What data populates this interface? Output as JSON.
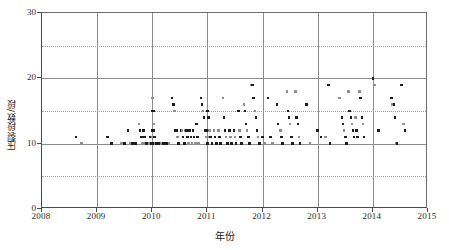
{
  "chart_data": {
    "type": "scatter",
    "title": "",
    "xlabel": "年份",
    "ylabel": "压裂段数/段",
    "xlim": [
      2008,
      2015
    ],
    "ylim": [
      0,
      30
    ],
    "x_ticks": [
      2008,
      2009,
      2010,
      2011,
      2012,
      2013,
      2014,
      2015
    ],
    "y_ticks": [
      0,
      10,
      20,
      30
    ],
    "y_gridlines_solid": [
      10,
      20
    ],
    "y_gridlines_dotted": [
      5,
      15,
      25
    ],
    "grid": "vertical solid at each year; horizontal solid at 10 and 20; horizontal dotted at 5, 15, 25",
    "legend": "none",
    "marker": "small filled square",
    "marker_colors": [
      "#1c1c1c",
      "#8f8f8f"
    ],
    "series": [
      {
        "name": "压裂段数",
        "points": [
          [
            2008.62,
            11.0
          ],
          [
            2008.72,
            10.0
          ],
          [
            2009.19,
            11.0
          ],
          [
            2009.26,
            10.0
          ],
          [
            2009.44,
            10.0
          ],
          [
            2009.5,
            10.0
          ],
          [
            2009.56,
            12.0
          ],
          [
            2009.6,
            10.0
          ],
          [
            2009.64,
            10.0
          ],
          [
            2009.7,
            10.0
          ],
          [
            2009.76,
            13.0
          ],
          [
            2009.78,
            12.0
          ],
          [
            2009.8,
            11.0
          ],
          [
            2009.82,
            10.0
          ],
          [
            2009.84,
            12.0
          ],
          [
            2009.86,
            11.0
          ],
          [
            2009.88,
            10.0
          ],
          [
            2009.9,
            10.0
          ],
          [
            2009.92,
            10.0
          ],
          [
            2009.94,
            10.0
          ],
          [
            2009.96,
            11.0
          ],
          [
            2009.98,
            10.0
          ],
          [
            2010.0,
            17.0
          ],
          [
            2010.0,
            15.0
          ],
          [
            2010.0,
            12.0
          ],
          [
            2010.0,
            11.0
          ],
          [
            2010.0,
            10.0
          ],
          [
            2010.02,
            15.0
          ],
          [
            2010.02,
            13.0
          ],
          [
            2010.03,
            12.0
          ],
          [
            2010.04,
            11.0
          ],
          [
            2010.05,
            10.0
          ],
          [
            2010.08,
            10.0
          ],
          [
            2010.12,
            10.0
          ],
          [
            2010.16,
            10.0
          ],
          [
            2010.2,
            10.0
          ],
          [
            2010.26,
            10.0
          ],
          [
            2010.3,
            10.0
          ],
          [
            2010.36,
            17.0
          ],
          [
            2010.38,
            16.0
          ],
          [
            2010.4,
            15.0
          ],
          [
            2010.42,
            12.0
          ],
          [
            2010.44,
            12.0
          ],
          [
            2010.46,
            11.0
          ],
          [
            2010.48,
            10.0
          ],
          [
            2010.52,
            12.0
          ],
          [
            2010.54,
            12.0
          ],
          [
            2010.56,
            11.0
          ],
          [
            2010.58,
            10.0
          ],
          [
            2010.6,
            12.0
          ],
          [
            2010.62,
            12.0
          ],
          [
            2010.64,
            11.0
          ],
          [
            2010.66,
            10.0
          ],
          [
            2010.68,
            12.0
          ],
          [
            2010.7,
            11.0
          ],
          [
            2010.72,
            10.0
          ],
          [
            2010.74,
            12.0
          ],
          [
            2010.76,
            11.0
          ],
          [
            2010.78,
            10.0
          ],
          [
            2010.8,
            13.0
          ],
          [
            2010.82,
            11.0
          ],
          [
            2010.84,
            10.0
          ],
          [
            2010.88,
            17.0
          ],
          [
            2010.9,
            16.0
          ],
          [
            2010.92,
            15.0
          ],
          [
            2010.94,
            14.0
          ],
          [
            2010.96,
            12.0
          ],
          [
            2010.98,
            11.0
          ],
          [
            2011.0,
            15.0
          ],
          [
            2011.0,
            12.0
          ],
          [
            2011.0,
            11.0
          ],
          [
            2011.0,
            10.0
          ],
          [
            2011.02,
            14.0
          ],
          [
            2011.04,
            12.0
          ],
          [
            2011.06,
            11.0
          ],
          [
            2011.08,
            10.0
          ],
          [
            2011.12,
            12.0
          ],
          [
            2011.14,
            11.0
          ],
          [
            2011.16,
            10.0
          ],
          [
            2011.2,
            12.0
          ],
          [
            2011.22,
            11.0
          ],
          [
            2011.24,
            10.0
          ],
          [
            2011.28,
            17.0
          ],
          [
            2011.3,
            14.0
          ],
          [
            2011.32,
            12.0
          ],
          [
            2011.34,
            11.0
          ],
          [
            2011.36,
            10.0
          ],
          [
            2011.4,
            12.0
          ],
          [
            2011.42,
            11.0
          ],
          [
            2011.44,
            10.0
          ],
          [
            2011.48,
            12.0
          ],
          [
            2011.5,
            11.0
          ],
          [
            2011.52,
            10.0
          ],
          [
            2011.56,
            15.0
          ],
          [
            2011.58,
            12.0
          ],
          [
            2011.6,
            11.0
          ],
          [
            2011.62,
            10.0
          ],
          [
            2011.66,
            16.0
          ],
          [
            2011.68,
            15.0
          ],
          [
            2011.7,
            13.0
          ],
          [
            2011.72,
            12.0
          ],
          [
            2011.74,
            11.0
          ],
          [
            2011.76,
            10.0
          ],
          [
            2011.8,
            19.0
          ],
          [
            2011.82,
            19.0
          ],
          [
            2011.84,
            17.0
          ],
          [
            2011.86,
            15.0
          ],
          [
            2011.88,
            14.0
          ],
          [
            2011.9,
            12.0
          ],
          [
            2011.92,
            11.0
          ],
          [
            2011.94,
            10.0
          ],
          [
            2012.0,
            11.0
          ],
          [
            2012.04,
            10.0
          ],
          [
            2012.1,
            17.0
          ],
          [
            2012.14,
            11.0
          ],
          [
            2012.18,
            10.0
          ],
          [
            2012.26,
            16.0
          ],
          [
            2012.28,
            13.0
          ],
          [
            2012.32,
            12.0
          ],
          [
            2012.34,
            11.0
          ],
          [
            2012.36,
            10.0
          ],
          [
            2012.44,
            18.0
          ],
          [
            2012.46,
            15.0
          ],
          [
            2012.48,
            14.0
          ],
          [
            2012.5,
            13.0
          ],
          [
            2012.52,
            11.0
          ],
          [
            2012.54,
            10.0
          ],
          [
            2012.6,
            18.0
          ],
          [
            2012.62,
            14.0
          ],
          [
            2012.64,
            13.0
          ],
          [
            2012.66,
            11.0
          ],
          [
            2012.68,
            10.0
          ],
          [
            2012.8,
            16.0
          ],
          [
            2012.86,
            10.0
          ],
          [
            2013.0,
            12.0
          ],
          [
            2013.06,
            11.0
          ],
          [
            2013.14,
            11.0
          ],
          [
            2013.2,
            19.0
          ],
          [
            2013.22,
            10.0
          ],
          [
            2013.4,
            17.0
          ],
          [
            2013.44,
            14.0
          ],
          [
            2013.46,
            13.0
          ],
          [
            2013.48,
            12.0
          ],
          [
            2013.5,
            11.0
          ],
          [
            2013.52,
            10.0
          ],
          [
            2013.56,
            18.0
          ],
          [
            2013.58,
            15.0
          ],
          [
            2013.6,
            14.0
          ],
          [
            2013.62,
            13.0
          ],
          [
            2013.64,
            12.0
          ],
          [
            2013.66,
            11.0
          ],
          [
            2013.68,
            14.0
          ],
          [
            2013.7,
            12.0
          ],
          [
            2013.72,
            11.0
          ],
          [
            2013.76,
            18.0
          ],
          [
            2013.78,
            17.0
          ],
          [
            2013.8,
            14.0
          ],
          [
            2013.82,
            13.0
          ],
          [
            2013.84,
            11.0
          ],
          [
            2014.0,
            20.0
          ],
          [
            2014.04,
            19.0
          ],
          [
            2014.1,
            12.0
          ],
          [
            2014.34,
            17.0
          ],
          [
            2014.36,
            16.0
          ],
          [
            2014.38,
            16.0
          ],
          [
            2014.4,
            14.0
          ],
          [
            2014.42,
            10.0
          ],
          [
            2014.44,
            10.0
          ],
          [
            2014.52,
            19.0
          ],
          [
            2014.56,
            13.0
          ],
          [
            2014.58,
            12.0
          ]
        ]
      }
    ]
  },
  "axes": {
    "x_tick_labels": [
      "2008",
      "2009",
      "2010",
      "2011",
      "2012",
      "2013",
      "2014",
      "2015"
    ],
    "y_tick_labels": [
      "0",
      "10",
      "20",
      "30"
    ],
    "x_title": "年份",
    "y_title": "压裂段数/段"
  }
}
